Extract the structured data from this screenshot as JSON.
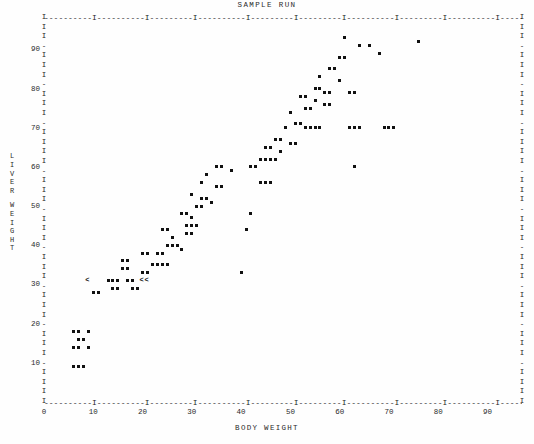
{
  "chart_data": {
    "type": "scatter",
    "title": "SAMPLE RUN",
    "xlabel": "BODY WEIGHT",
    "ylabel": "LIVER WEIGHT",
    "xlim": [
      0,
      97
    ],
    "ylim": [
      0,
      98
    ],
    "xticks": [
      0,
      10,
      20,
      30,
      40,
      50,
      60,
      70,
      80,
      90
    ],
    "yticks": [
      10,
      20,
      30,
      40,
      50,
      60,
      70,
      80,
      90
    ],
    "grid": false,
    "legend": null,
    "marker": "*",
    "special_marker": "<",
    "points": [
      [
        6,
        9
      ],
      [
        7,
        9
      ],
      [
        8,
        9
      ],
      [
        6,
        14
      ],
      [
        7,
        14
      ],
      [
        9,
        14
      ],
      [
        7,
        16
      ],
      [
        8,
        16
      ],
      [
        6,
        18
      ],
      [
        7,
        18
      ],
      [
        9,
        18
      ],
      [
        10,
        28
      ],
      [
        11,
        28
      ],
      [
        14,
        29
      ],
      [
        15,
        29
      ],
      [
        13,
        31
      ],
      [
        14,
        31
      ],
      [
        15,
        31
      ],
      [
        17,
        31
      ],
      [
        18,
        31
      ],
      [
        18,
        29
      ],
      [
        19,
        29
      ],
      [
        16,
        34
      ],
      [
        17,
        34
      ],
      [
        16,
        36
      ],
      [
        17,
        36
      ],
      [
        20,
        33
      ],
      [
        21,
        33
      ],
      [
        22,
        35
      ],
      [
        23,
        35
      ],
      [
        24,
        35
      ],
      [
        25,
        35
      ],
      [
        20,
        38
      ],
      [
        21,
        38
      ],
      [
        23,
        38
      ],
      [
        24,
        38
      ],
      [
        25,
        40
      ],
      [
        26,
        40
      ],
      [
        27,
        40
      ],
      [
        26,
        42
      ],
      [
        24,
        44
      ],
      [
        25,
        44
      ],
      [
        28,
        39
      ],
      [
        29,
        43
      ],
      [
        30,
        43
      ],
      [
        29,
        45
      ],
      [
        30,
        45
      ],
      [
        31,
        45
      ],
      [
        30,
        47
      ],
      [
        28,
        48
      ],
      [
        29,
        48
      ],
      [
        31,
        50
      ],
      [
        32,
        50
      ],
      [
        32,
        52
      ],
      [
        33,
        52
      ],
      [
        34,
        51
      ],
      [
        30,
        53
      ],
      [
        32,
        56
      ],
      [
        35,
        55
      ],
      [
        36,
        55
      ],
      [
        33,
        58
      ],
      [
        35,
        60
      ],
      [
        36,
        60
      ],
      [
        38,
        59
      ],
      [
        40,
        33
      ],
      [
        41,
        44
      ],
      [
        42,
        48
      ],
      [
        44,
        56
      ],
      [
        45,
        56
      ],
      [
        46,
        56
      ],
      [
        42,
        60
      ],
      [
        43,
        60
      ],
      [
        44,
        62
      ],
      [
        45,
        62
      ],
      [
        46,
        62
      ],
      [
        47,
        62
      ],
      [
        45,
        65
      ],
      [
        46,
        65
      ],
      [
        48,
        64
      ],
      [
        47,
        67
      ],
      [
        48,
        67
      ],
      [
        50,
        66
      ],
      [
        51,
        66
      ],
      [
        49,
        70
      ],
      [
        51,
        71
      ],
      [
        52,
        71
      ],
      [
        50,
        74
      ],
      [
        53,
        70
      ],
      [
        54,
        70
      ],
      [
        55,
        70
      ],
      [
        56,
        70
      ],
      [
        53,
        75
      ],
      [
        54,
        75
      ],
      [
        55,
        77
      ],
      [
        52,
        78
      ],
      [
        53,
        78
      ],
      [
        55,
        80
      ],
      [
        56,
        80
      ],
      [
        57,
        76
      ],
      [
        58,
        76
      ],
      [
        57,
        79
      ],
      [
        58,
        79
      ],
      [
        56,
        83
      ],
      [
        58,
        85
      ],
      [
        59,
        85
      ],
      [
        60,
        88
      ],
      [
        61,
        88
      ],
      [
        60,
        82
      ],
      [
        62,
        79
      ],
      [
        63,
        79
      ],
      [
        62,
        70
      ],
      [
        63,
        70
      ],
      [
        64,
        70
      ],
      [
        64,
        91
      ],
      [
        66,
        91
      ],
      [
        61,
        93
      ],
      [
        63,
        60
      ],
      [
        68,
        89
      ],
      [
        69,
        70
      ],
      [
        70,
        70
      ],
      [
        71,
        70
      ],
      [
        76,
        92
      ]
    ],
    "special_points": [
      [
        9,
        31
      ],
      [
        20,
        31
      ],
      [
        21,
        31
      ]
    ]
  },
  "axis_titles": {
    "x": "BODY WEIGHT",
    "y_chars": [
      "L",
      "I",
      "V",
      "E",
      "R",
      "",
      "W",
      "E",
      "I",
      "G",
      "H",
      "T"
    ]
  }
}
